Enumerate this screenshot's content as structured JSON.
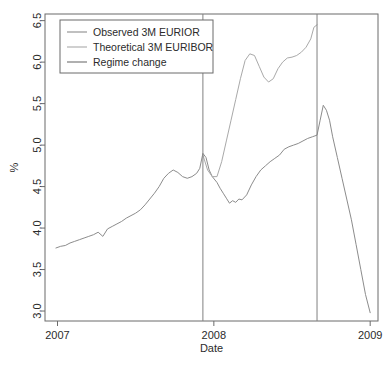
{
  "chart_data": {
    "type": "line",
    "title": "",
    "xlabel": "Date",
    "ylabel": "%",
    "xlim": [
      2006.92,
      2009.05
    ],
    "ylim": [
      2.88,
      6.58
    ],
    "grid": false,
    "xticks": [
      2007,
      2008,
      2009
    ],
    "xtick_labels": [
      "2007",
      "2008",
      "2009"
    ],
    "yticks": [
      3.0,
      3.5,
      4.0,
      4.5,
      5.0,
      5.5,
      6.0,
      6.5
    ],
    "ytick_labels": [
      "3.0",
      "3.5",
      "4.0",
      "4.5",
      "5.0",
      "5.5",
      "6.0",
      "6.5"
    ],
    "legend_position": "top-left",
    "legend": [
      {
        "name": "Observed 3M EURIOR",
        "color": "#8c8c8c"
      },
      {
        "name": "Theoretical 3M EURIBOR",
        "color": "#a9a9a9"
      },
      {
        "name": "Regime change",
        "color": "#707070"
      }
    ],
    "annotations": [
      {
        "type": "vline",
        "label": "Regime change",
        "x": 2007.93,
        "color": "#808080"
      },
      {
        "type": "vline",
        "label": "Regime change",
        "x": 2008.66,
        "color": "#808080"
      }
    ],
    "series": [
      {
        "name": "Observed 3M EURIOR",
        "color": "#8c8c8c",
        "x": [
          2006.99,
          2007.02,
          2007.05,
          2007.08,
          2007.11,
          2007.14,
          2007.17,
          2007.2,
          2007.23,
          2007.26,
          2007.29,
          2007.32,
          2007.35,
          2007.38,
          2007.41,
          2007.44,
          2007.47,
          2007.5,
          2007.53,
          2007.56,
          2007.59,
          2007.62,
          2007.65,
          2007.68,
          2007.71,
          2007.74,
          2007.77,
          2007.8,
          2007.83,
          2007.86,
          2007.89,
          2007.91,
          2007.93,
          2007.95,
          2007.97,
          2007.99,
          2008.02,
          2008.04,
          2008.06,
          2008.08,
          2008.1,
          2008.12,
          2008.14,
          2008.16,
          2008.18,
          2008.21,
          2008.24,
          2008.27,
          2008.3,
          2008.33,
          2008.36,
          2008.39,
          2008.42,
          2008.45,
          2008.48,
          2008.51,
          2008.54,
          2008.57,
          2008.6,
          2008.63,
          2008.66,
          2008.68,
          2008.7,
          2008.72,
          2008.74,
          2008.76,
          2008.79,
          2008.82,
          2008.85,
          2008.88,
          2008.91,
          2008.94,
          2008.97,
          2009.0
        ],
        "y": [
          3.76,
          3.78,
          3.79,
          3.82,
          3.84,
          3.86,
          3.88,
          3.9,
          3.92,
          3.95,
          3.9,
          3.99,
          4.02,
          4.05,
          4.08,
          4.12,
          4.15,
          4.18,
          4.22,
          4.28,
          4.35,
          4.42,
          4.5,
          4.6,
          4.66,
          4.7,
          4.67,
          4.62,
          4.6,
          4.62,
          4.66,
          4.72,
          4.9,
          4.85,
          4.7,
          4.62,
          4.55,
          4.48,
          4.42,
          4.36,
          4.3,
          4.33,
          4.31,
          4.35,
          4.34,
          4.4,
          4.52,
          4.62,
          4.7,
          4.75,
          4.8,
          4.84,
          4.88,
          4.95,
          4.98,
          5.0,
          5.02,
          5.05,
          5.08,
          5.1,
          5.12,
          5.3,
          5.48,
          5.42,
          5.3,
          5.1,
          4.85,
          4.6,
          4.35,
          4.1,
          3.8,
          3.5,
          3.2,
          2.98
        ]
      },
      {
        "name": "Theoretical 3M EURIBOR",
        "color": "#a9a9a9",
        "x": [
          2007.93,
          2007.96,
          2007.99,
          2008.02,
          2008.05,
          2008.08,
          2008.11,
          2008.14,
          2008.17,
          2008.2,
          2008.23,
          2008.26,
          2008.29,
          2008.32,
          2008.35,
          2008.38,
          2008.41,
          2008.44,
          2008.47,
          2008.5,
          2008.53,
          2008.56,
          2008.59,
          2008.62,
          2008.64,
          2008.66
        ],
        "y": [
          4.88,
          4.7,
          4.62,
          4.62,
          4.8,
          5.05,
          5.3,
          5.55,
          5.8,
          6.02,
          6.1,
          6.08,
          5.95,
          5.82,
          5.76,
          5.8,
          5.92,
          6.0,
          6.05,
          6.06,
          6.08,
          6.12,
          6.18,
          6.28,
          6.42,
          6.45
        ]
      }
    ]
  }
}
